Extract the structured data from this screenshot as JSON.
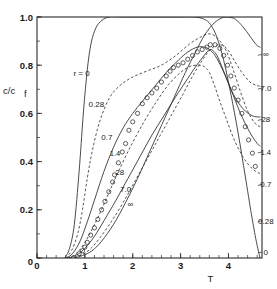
{
  "chart_data": {
    "type": "line",
    "title": "",
    "subtitle": "",
    "xlabel": "T",
    "ylabel": "c/c_f",
    "ylabel_base": "c/c",
    "ylabel_sub": "f",
    "xlim": [
      0,
      4.7
    ],
    "ylim": [
      0,
      1.0
    ],
    "grid": false,
    "legend_position": "inline-curve-labels",
    "x_ticks": [
      0,
      1,
      2,
      3,
      4
    ],
    "x_tick_labels": [
      "0",
      "1",
      "2",
      "3",
      "4"
    ],
    "x_minor_step": 0.2,
    "y_ticks": [
      0,
      0.2,
      0.4,
      0.6,
      0.8,
      1.0
    ],
    "y_tick_labels": [
      "0",
      "0.2",
      "0.4",
      "0.6",
      "0.8",
      "1.0"
    ],
    "y_minor_step": 0.1,
    "series_parameter_name": "r",
    "series": [
      {
        "name": "0",
        "label": "0",
        "style": "solid",
        "left_label": "r = 0",
        "right_label": "0",
        "x": [
          0.58,
          0.68,
          0.78,
          0.88,
          0.96,
          1.02,
          1.08,
          1.14,
          1.22,
          1.32,
          1.5,
          1.8,
          2.2,
          2.6,
          3.0,
          3.3,
          3.5,
          3.62,
          3.75,
          3.9,
          4.05,
          4.2,
          4.35,
          4.48,
          4.58,
          4.66
        ],
        "y": [
          0.0,
          0.04,
          0.14,
          0.36,
          0.58,
          0.72,
          0.83,
          0.9,
          0.95,
          0.98,
          1.0,
          1.0,
          1.0,
          1.0,
          1.0,
          1.0,
          0.99,
          0.97,
          0.92,
          0.82,
          0.68,
          0.52,
          0.34,
          0.18,
          0.07,
          0.0
        ]
      },
      {
        "name": "0.28",
        "label": "0.28",
        "style": "dashed",
        "left_label": "0.28",
        "right_label": "0.28",
        "x": [
          0.6,
          0.72,
          0.85,
          0.95,
          1.05,
          1.15,
          1.3,
          1.5,
          1.7,
          1.9,
          2.1,
          2.35,
          2.6,
          2.9,
          3.2,
          3.45,
          3.62,
          3.78,
          3.95,
          4.1,
          4.25,
          4.4,
          4.55,
          4.66
        ],
        "y": [
          0.0,
          0.03,
          0.1,
          0.2,
          0.33,
          0.44,
          0.56,
          0.66,
          0.71,
          0.74,
          0.76,
          0.78,
          0.8,
          0.84,
          0.89,
          0.92,
          0.93,
          0.91,
          0.86,
          0.78,
          0.69,
          0.61,
          0.56,
          0.545
        ]
      },
      {
        "name": "0.7",
        "label": "0.7",
        "style": "solid",
        "left_label": "0.7",
        "right_label": "0.7",
        "x": [
          0.62,
          0.75,
          0.9,
          1.05,
          1.2,
          1.4,
          1.6,
          1.8,
          2.0,
          2.2,
          2.45,
          2.7,
          2.95,
          3.15,
          3.35,
          3.5,
          3.6,
          3.72,
          3.88,
          4.05,
          4.25,
          4.45,
          4.6,
          4.66
        ],
        "y": [
          0.0,
          0.02,
          0.07,
          0.15,
          0.24,
          0.36,
          0.46,
          0.54,
          0.6,
          0.65,
          0.71,
          0.77,
          0.82,
          0.855,
          0.875,
          0.875,
          0.865,
          0.84,
          0.78,
          0.7,
          0.6,
          0.52,
          0.475,
          0.465
        ]
      },
      {
        "name": "1.4",
        "label": "1.4",
        "style": "dashed",
        "left_label": "1.4",
        "right_label": "1.4",
        "x": [
          0.63,
          0.8,
          0.95,
          1.1,
          1.3,
          1.5,
          1.75,
          2.0,
          2.25,
          2.5,
          2.75,
          3.0,
          3.2,
          3.35,
          3.45,
          3.52,
          3.6,
          3.7,
          3.82,
          3.95,
          4.1,
          4.3,
          4.5,
          4.66
        ],
        "y": [
          0.0,
          0.015,
          0.05,
          0.1,
          0.18,
          0.27,
          0.38,
          0.48,
          0.57,
          0.65,
          0.72,
          0.77,
          0.795,
          0.8,
          0.798,
          0.79,
          0.77,
          0.72,
          0.65,
          0.58,
          0.5,
          0.42,
          0.37,
          0.35
        ]
      },
      {
        "name": "28",
        "label": "28",
        "style": "solid",
        "left_label": "28",
        "right_label": "28",
        "x": [
          0.66,
          0.85,
          1.0,
          1.2,
          1.4,
          1.65,
          1.9,
          2.15,
          2.4,
          2.65,
          2.9,
          3.1,
          3.3,
          3.45,
          3.55,
          3.62,
          3.68,
          3.76,
          3.85,
          3.95,
          4.1,
          4.3,
          4.5,
          4.66
        ],
        "y": [
          0.0,
          0.015,
          0.04,
          0.09,
          0.155,
          0.24,
          0.33,
          0.42,
          0.51,
          0.59,
          0.67,
          0.73,
          0.79,
          0.83,
          0.855,
          0.865,
          0.86,
          0.84,
          0.8,
          0.75,
          0.68,
          0.62,
          0.59,
          0.585
        ]
      },
      {
        "name": "7.0",
        "label": "7.0",
        "style": "dashed",
        "left_label": "7.0",
        "right_label": "7.0",
        "x": [
          0.68,
          0.9,
          1.1,
          1.3,
          1.55,
          1.8,
          2.05,
          2.3,
          2.55,
          2.8,
          3.05,
          3.25,
          3.45,
          3.6,
          3.72,
          3.82,
          3.9,
          4.0,
          4.12,
          4.28,
          4.45,
          4.6,
          4.66
        ],
        "y": [
          0.0,
          0.01,
          0.035,
          0.08,
          0.15,
          0.23,
          0.32,
          0.41,
          0.5,
          0.59,
          0.68,
          0.755,
          0.82,
          0.86,
          0.88,
          0.885,
          0.88,
          0.86,
          0.82,
          0.77,
          0.73,
          0.715,
          0.715
        ]
      },
      {
        "name": "inf",
        "label": "∞",
        "style": "solid",
        "left_label": "∞",
        "right_label": "∞",
        "x": [
          0.78,
          0.95,
          1.15,
          1.35,
          1.6,
          1.85,
          2.1,
          2.35,
          2.6,
          2.85,
          3.1,
          3.3,
          3.5,
          3.7,
          3.85,
          3.95,
          4.05,
          4.15,
          4.3,
          4.45,
          4.58,
          4.66
        ],
        "y": [
          0.0,
          0.01,
          0.03,
          0.07,
          0.14,
          0.23,
          0.33,
          0.44,
          0.55,
          0.66,
          0.77,
          0.85,
          0.925,
          0.975,
          0.995,
          1.0,
          0.998,
          0.99,
          0.96,
          0.92,
          0.885,
          0.875
        ]
      }
    ],
    "scatter": {
      "marker": "open-circle",
      "marker_radius_px": 2.1,
      "label": "experimental data",
      "points": [
        [
          0.88,
          0.018
        ],
        [
          0.95,
          0.03
        ],
        [
          1.0,
          0.045
        ],
        [
          1.05,
          0.065
        ],
        [
          1.12,
          0.095
        ],
        [
          1.2,
          0.125
        ],
        [
          1.27,
          0.16
        ],
        [
          1.35,
          0.2
        ],
        [
          1.42,
          0.235
        ],
        [
          1.5,
          0.275
        ],
        [
          1.58,
          0.315
        ],
        [
          1.62,
          0.345
        ],
        [
          1.7,
          0.395
        ],
        [
          1.78,
          0.44
        ],
        [
          1.85,
          0.475
        ],
        [
          1.92,
          0.53
        ],
        [
          2.0,
          0.565
        ],
        [
          2.1,
          0.6
        ],
        [
          2.2,
          0.64
        ],
        [
          2.3,
          0.665
        ],
        [
          2.4,
          0.685
        ],
        [
          2.5,
          0.705
        ],
        [
          2.6,
          0.73
        ],
        [
          2.7,
          0.755
        ],
        [
          2.78,
          0.775
        ],
        [
          2.85,
          0.79
        ],
        [
          2.95,
          0.8
        ],
        [
          3.05,
          0.81
        ],
        [
          3.15,
          0.825
        ],
        [
          3.25,
          0.84
        ],
        [
          3.35,
          0.855
        ],
        [
          3.45,
          0.865
        ],
        [
          3.55,
          0.875
        ],
        [
          3.62,
          0.885
        ],
        [
          3.72,
          0.885
        ],
        [
          3.82,
          0.87
        ],
        [
          3.9,
          0.84
        ],
        [
          3.98,
          0.8
        ],
        [
          4.05,
          0.755
        ],
        [
          4.12,
          0.705
        ],
        [
          4.2,
          0.655
        ],
        [
          4.28,
          0.6
        ],
        [
          4.35,
          0.545
        ],
        [
          4.42,
          0.49
        ],
        [
          4.5,
          0.435
        ],
        [
          4.56,
          0.38
        ]
      ]
    },
    "left_labels": [
      {
        "text": "r = 0",
        "x": 0.93,
        "y": 0.755,
        "size": "normal"
      },
      {
        "text": "0.28",
        "x": 1.24,
        "y": 0.625,
        "size": "normal"
      },
      {
        "text": "0.7",
        "x": 1.46,
        "y": 0.49,
        "size": "normal"
      },
      {
        "text": "1.4",
        "x": 1.63,
        "y": 0.425,
        "size": "small"
      },
      {
        "text": "28",
        "x": 1.73,
        "y": 0.345,
        "size": "normal"
      },
      {
        "text": "7.0",
        "x": 1.85,
        "y": 0.275,
        "size": "normal"
      },
      {
        "text": "∞",
        "x": 1.95,
        "y": 0.21,
        "size": "normal"
      }
    ],
    "right_labels": [
      {
        "text": "∞",
        "x": 4.78,
        "y": 0.845,
        "size": "normal"
      },
      {
        "text": "7.0",
        "x": 4.78,
        "y": 0.705,
        "size": "normal"
      },
      {
        "text": "28",
        "x": 4.78,
        "y": 0.575,
        "size": "normal"
      },
      {
        "text": "1.4",
        "x": 4.78,
        "y": 0.44,
        "size": "small"
      },
      {
        "text": "0.7",
        "x": 4.78,
        "y": 0.305,
        "size": "normal"
      },
      {
        "text": "0.28",
        "x": 4.78,
        "y": 0.155,
        "size": "normal"
      },
      {
        "text": "0",
        "x": 4.78,
        "y": 0.025,
        "size": "normal"
      }
    ],
    "colors": {
      "axis": "#2a2a2a",
      "curve": "#2a2a2a",
      "marker": "#2a2a2a",
      "background": "#ffffff"
    }
  }
}
